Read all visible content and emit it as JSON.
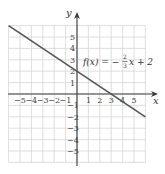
{
  "chart_data": {
    "type": "line",
    "title": "",
    "xlabel": "x",
    "ylabel": "y",
    "xlim": [
      -6,
      6
    ],
    "ylim": [
      -6,
      6
    ],
    "grid": true,
    "x_ticks": [
      -5,
      -4,
      -3,
      -2,
      -1,
      1,
      2,
      3,
      4,
      5
    ],
    "y_ticks": [
      -5,
      -4,
      -3,
      -2,
      -1,
      1,
      2,
      3,
      4,
      5
    ],
    "x_tick_labels": [
      "−5",
      "−4",
      "−3",
      "−2",
      "−1",
      "1",
      "2",
      "3",
      "4",
      "5"
    ],
    "y_tick_labels": [
      "−5",
      "−4",
      "−3",
      "−2",
      "−1",
      "1",
      "2",
      "3",
      "4",
      "5"
    ],
    "series": [
      {
        "name": "f(x) = −(2/3)x + 2",
        "slope": -0.6667,
        "intercept": 2,
        "x": [
          -6,
          6
        ],
        "y": [
          6,
          -2
        ]
      }
    ],
    "annotations": [
      {
        "text": "f(x) = −(2/3)x + 2",
        "x": 1.8,
        "y": 3
      }
    ]
  },
  "labels": {
    "x_axis": "x",
    "y_axis": "y",
    "equation_lhs": "f(x) = −",
    "equation_num": "2",
    "equation_den": "3",
    "equation_rhs": "x + 2"
  }
}
